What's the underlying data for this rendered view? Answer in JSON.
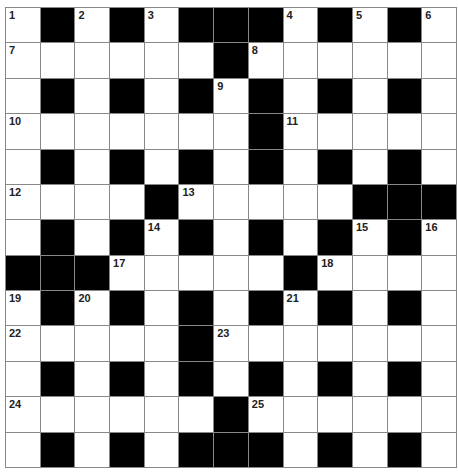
{
  "puzzle": {
    "rows": 13,
    "cols": 13,
    "layout": [
      "W.W.W...W.W.W",
      "WWWWWW.WWWWWW",
      "W.W.W.W.W.W.W",
      "WWWWWWW.WWWWW",
      "W.W.W.W.W.W.W",
      "WWWW.WWWWW...",
      "W.W.W.W.W.W.W",
      "...WWWWW.WWWW",
      "W.W.W.W.W.W.W",
      "WWWWW.WWWWWWW",
      "W.W.W.W.W.W.W",
      "WWWWWW.WWWWWW",
      "W.W.W...W.W.W"
    ],
    "numbers": [
      {
        "r": 0,
        "c": 0,
        "n": "1"
      },
      {
        "r": 0,
        "c": 2,
        "n": "2"
      },
      {
        "r": 0,
        "c": 4,
        "n": "3"
      },
      {
        "r": 0,
        "c": 8,
        "n": "4"
      },
      {
        "r": 0,
        "c": 10,
        "n": "5"
      },
      {
        "r": 0,
        "c": 12,
        "n": "6"
      },
      {
        "r": 1,
        "c": 0,
        "n": "7"
      },
      {
        "r": 1,
        "c": 7,
        "n": "8"
      },
      {
        "r": 2,
        "c": 6,
        "n": "9"
      },
      {
        "r": 3,
        "c": 0,
        "n": "10"
      },
      {
        "r": 3,
        "c": 8,
        "n": "11"
      },
      {
        "r": 5,
        "c": 0,
        "n": "12"
      },
      {
        "r": 5,
        "c": 5,
        "n": "13"
      },
      {
        "r": 6,
        "c": 4,
        "n": "14"
      },
      {
        "r": 6,
        "c": 10,
        "n": "15"
      },
      {
        "r": 6,
        "c": 12,
        "n": "16"
      },
      {
        "r": 7,
        "c": 3,
        "n": "17"
      },
      {
        "r": 7,
        "c": 9,
        "n": "18"
      },
      {
        "r": 8,
        "c": 0,
        "n": "19"
      },
      {
        "r": 8,
        "c": 2,
        "n": "20"
      },
      {
        "r": 8,
        "c": 8,
        "n": "21"
      },
      {
        "r": 9,
        "c": 0,
        "n": "22"
      },
      {
        "r": 9,
        "c": 6,
        "n": "23"
      },
      {
        "r": 11,
        "c": 0,
        "n": "24"
      },
      {
        "r": 11,
        "c": 7,
        "n": "25"
      }
    ]
  }
}
